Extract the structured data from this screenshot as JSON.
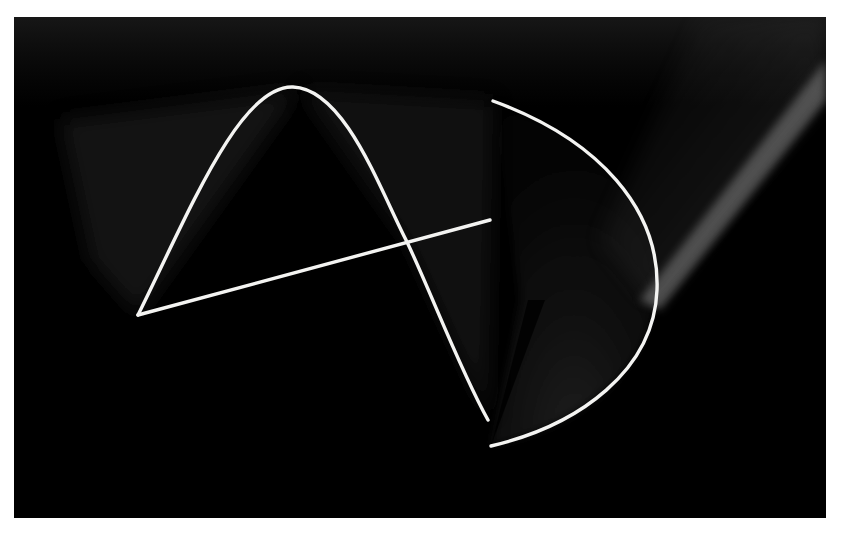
{
  "image": {
    "kind": "light-painting photograph",
    "description": "Long-exposure light trails on black background forming an abstract figure resembling a letter A and a D-shaped arc",
    "colors": {
      "background": "#ffffff",
      "frame": "#000000",
      "trail": "#f4f4f2",
      "glow": "#5a5a5a"
    },
    "shapes": [
      {
        "name": "sine-arch-trail",
        "start": [
          138,
          315
        ],
        "peak": [
          293,
          87
        ],
        "crossing": [
          407,
          242
        ],
        "end": [
          488,
          420
        ]
      },
      {
        "name": "straight-line-trail",
        "start": [
          138,
          315
        ],
        "end": [
          490,
          220
        ]
      },
      {
        "name": "d-arc-trail",
        "start": [
          493,
          101
        ],
        "rightmost": [
          657,
          290
        ],
        "end": [
          491,
          446
        ]
      },
      {
        "name": "diagonal-glow",
        "start": [
          826,
          85
        ],
        "end": [
          650,
          300
        ]
      }
    ]
  }
}
